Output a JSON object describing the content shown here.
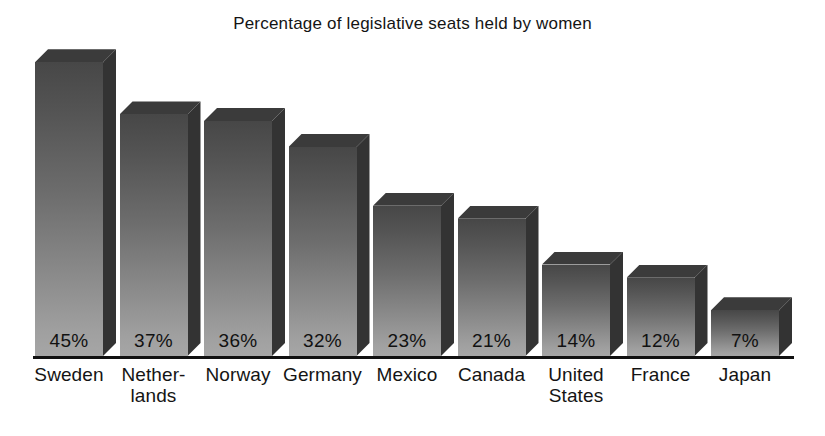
{
  "chart_data": {
    "type": "bar",
    "title": "Percentage of legislative seats held by women",
    "xlabel": "",
    "ylabel": "",
    "ylim": [
      0,
      50
    ],
    "grid": false,
    "legend": "none",
    "categories": [
      "Sweden",
      "Netherlands",
      "Norway",
      "Germany",
      "Mexico",
      "Canada",
      "United States",
      "France",
      "Japan"
    ],
    "values": [
      45,
      37,
      36,
      32,
      23,
      21,
      14,
      12,
      7
    ],
    "value_labels": [
      "45%",
      "37%",
      "36%",
      "32%",
      "23%",
      "21%",
      "14%",
      "12%",
      "7%"
    ],
    "category_label_lines": [
      [
        "Sweden"
      ],
      [
        "Nether-",
        "lands"
      ],
      [
        "Norway"
      ],
      [
        "Germany"
      ],
      [
        "Mexico"
      ],
      [
        "Canada"
      ],
      [
        "United",
        "States"
      ],
      [
        "France"
      ],
      [
        "Japan"
      ]
    ],
    "style": {
      "bar_face_top_color": "#474747",
      "bar_face_bottom_color": "#a6a6a6",
      "bar_side_color": "#333333",
      "bar_top_color": "#3b3b3b",
      "axis_color": "#111111",
      "text_color": "#141414",
      "background": "#ffffff",
      "three_d": true
    },
    "geometry": {
      "baseline_y": 356,
      "first_bar_left": 35,
      "bar_width": 68,
      "bar_pitch": 84.5,
      "depth": 13,
      "pixels_per_unit": 6.53
    }
  }
}
